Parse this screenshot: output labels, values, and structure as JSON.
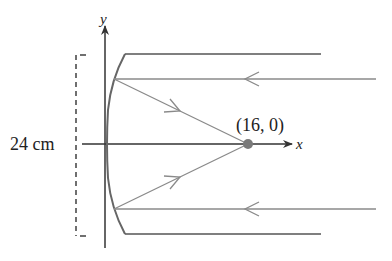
{
  "diagram": {
    "axes": {
      "x_label": "x",
      "y_label": "y"
    },
    "focus": {
      "label": "(16, 0)",
      "color": "#7a7a7a"
    },
    "aperture": {
      "label": "24 cm"
    },
    "colors": {
      "axis": "#333333",
      "mirror": "#666666",
      "ray": "#8a8a8a",
      "rim": "#555555",
      "dash": "#333333"
    },
    "rays": [
      {
        "name": "upper-incoming-ray",
        "direction": "leftward"
      },
      {
        "name": "lower-incoming-ray",
        "direction": "leftward"
      },
      {
        "name": "upper-reflected-ray",
        "direction": "toward-focus"
      },
      {
        "name": "lower-reflected-ray",
        "direction": "toward-focus"
      }
    ]
  }
}
